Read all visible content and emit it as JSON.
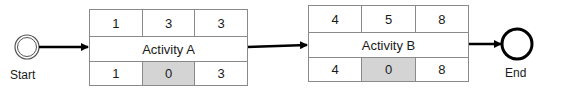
{
  "diagram": {
    "type": "activity-on-node network",
    "start": {
      "label": "Start"
    },
    "end": {
      "label": "End"
    },
    "activities": [
      {
        "name": "Activity A",
        "top": [
          "1",
          "3",
          "3"
        ],
        "bottom": [
          "1",
          "0",
          "3"
        ]
      },
      {
        "name": "Activity B",
        "top": [
          "4",
          "5",
          "8"
        ],
        "bottom": [
          "4",
          "0",
          "8"
        ]
      }
    ],
    "colors": {
      "border": "#8a8a8a",
      "shaded_cell": "#d4d4d4",
      "arrow": "#000000"
    }
  }
}
